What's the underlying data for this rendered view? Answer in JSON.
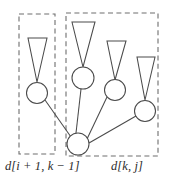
{
  "figure": {
    "width": 180,
    "height": 189,
    "background": "#ffffff",
    "stroke_color": "#4a4a4a",
    "dash_color": "#6e6e6e",
    "text_color": "#2b2b2b"
  },
  "captions": {
    "left": "d[i + 1, k − 1]",
    "right": "d[k, j]"
  },
  "boxes": [
    {
      "id": "left-group",
      "label": "d[i + 1, k − 1]",
      "x": 19,
      "y": 14,
      "width": 36,
      "height": 140
    },
    {
      "id": "right-group",
      "label": "d[k, j]",
      "x": 66,
      "y": 13,
      "width": 92,
      "height": 143
    }
  ],
  "nodes": [
    {
      "id": "left-child",
      "group": "left-group",
      "cx": 37,
      "cy": 93,
      "r": 10.5
    },
    {
      "id": "right-child-1",
      "group": "right-group",
      "cx": 83,
      "cy": 78,
      "r": 11
    },
    {
      "id": "right-child-2",
      "group": "right-group",
      "cx": 115,
      "cy": 90,
      "r": 10.5
    },
    {
      "id": "right-child-3",
      "group": "right-group",
      "cx": 145,
      "cy": 111,
      "r": 10.5
    },
    {
      "id": "root",
      "group": "right-group",
      "cx": 78,
      "cy": 144,
      "r": 11
    }
  ],
  "subtrees": [
    {
      "id": "subtree-left",
      "parent": "left-child",
      "apex_x": 37,
      "apex_y": 82,
      "top_y": 38,
      "top_left_x": 28,
      "top_right_x": 47
    },
    {
      "id": "subtree-right-1",
      "parent": "right-child-1",
      "apex_x": 83,
      "apex_y": 67,
      "top_y": 22,
      "top_left_x": 72,
      "top_right_x": 95
    },
    {
      "id": "subtree-right-2",
      "parent": "right-child-2",
      "apex_x": 115,
      "apex_y": 80,
      "top_y": 41,
      "top_left_x": 107,
      "top_right_x": 126
    },
    {
      "id": "subtree-right-3",
      "parent": "right-child-3",
      "apex_x": 145,
      "apex_y": 100,
      "top_y": 57,
      "top_left_x": 137,
      "top_right_x": 155
    }
  ],
  "edges": [
    {
      "id": "edge-root-left",
      "from": "left-child",
      "to": "root",
      "x1": 45,
      "y1": 100,
      "x2": 71,
      "y2": 137
    },
    {
      "id": "edge-root-child1",
      "from": "root",
      "to": "right-child-1",
      "x1": 76,
      "y1": 133,
      "x2": 81,
      "y2": 89
    },
    {
      "id": "edge-root-child2",
      "from": "root",
      "to": "right-child-2",
      "x1": 87,
      "y1": 139,
      "x2": 107,
      "y2": 97
    },
    {
      "id": "edge-root-child3",
      "from": "root",
      "to": "right-child-3",
      "x1": 89,
      "y1": 143,
      "x2": 136,
      "y2": 116
    }
  ]
}
